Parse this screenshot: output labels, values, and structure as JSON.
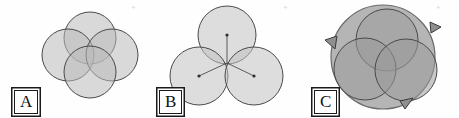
{
  "figure": {
    "caption_labels": [
      "A",
      "B",
      "C"
    ],
    "background_color": "#fefefe",
    "panel_count": 3
  },
  "style": {
    "circle_fill": "#b9b9b9",
    "circle_fill_light": "#c9c9c9",
    "circle_fill_dark": "#9a9a9a",
    "circle_stroke": "#4a4a4a",
    "outer_circle_fill": "#a8a8a8",
    "outer_circle_stroke": "#6a6a6a",
    "arrow_fill": "#8f8f8f",
    "arrow_stroke": "#4a4a4a",
    "label_text_color": "#111111",
    "label_border_color": "#1a1a1a",
    "registration_mark_color": "#d8d8d8",
    "fill_opacity": 0.55,
    "stroke_width": 1.0
  },
  "panels": [
    {
      "id": "panel-a",
      "label": "A",
      "description": "four overlapping circles in diamond arrangement",
      "circle_count": 4,
      "circle_radius": 26,
      "circles": [
        {
          "name": "top",
          "cx": 90,
          "cy": 38,
          "r": 26
        },
        {
          "name": "left",
          "cx": 68,
          "cy": 55,
          "r": 26
        },
        {
          "name": "right",
          "cx": 112,
          "cy": 55,
          "r": 26
        },
        {
          "name": "bottom",
          "cx": 90,
          "cy": 72,
          "r": 26
        }
      ],
      "registration_mark": {
        "x": 131,
        "y": 6,
        "glyph": "+"
      }
    },
    {
      "id": "panel-b",
      "label": "B",
      "description": "three circles in triangular arrangement with radii drawn to common center",
      "circle_count": 3,
      "circle_radius": 29,
      "circles": [
        {
          "name": "top",
          "cx": 77,
          "cy": 35,
          "r": 29
        },
        {
          "name": "bottom-left",
          "cx": 49,
          "cy": 76,
          "r": 29
        },
        {
          "name": "bottom-right",
          "cx": 104,
          "cy": 76,
          "r": 29
        }
      ],
      "common_center": {
        "cx": 77,
        "cy": 63
      },
      "center_dots": true,
      "radius_lines": true,
      "registration_mark": {
        "x": 133,
        "y": 6,
        "glyph": "+"
      }
    },
    {
      "id": "panel-c",
      "label": "C",
      "description": "three overlapping circles enclosed by a large outer circle with three rotation arrowheads",
      "circle_count": 3,
      "circle_radius": 31,
      "outer_circle": {
        "cx": 78,
        "cy": 57,
        "r": 52
      },
      "circles": [
        {
          "name": "top",
          "cx": 82,
          "cy": 40,
          "r": 31
        },
        {
          "name": "bottom-left",
          "cx": 60,
          "cy": 69,
          "r": 31
        },
        {
          "name": "bottom-right",
          "cx": 101,
          "cy": 70,
          "r": 31
        }
      ],
      "arrows": [
        {
          "name": "arrow-left",
          "position_deg": 200
        },
        {
          "name": "arrow-top-right",
          "position_deg": 325
        },
        {
          "name": "arrow-bottom-right",
          "position_deg": 72
        }
      ],
      "registration_mark": {
        "x": 131,
        "y": 6,
        "glyph": "+"
      }
    }
  ]
}
